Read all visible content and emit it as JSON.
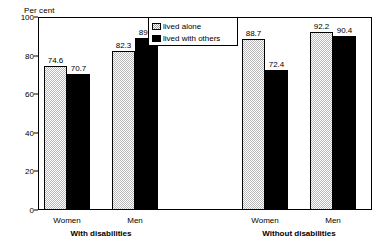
{
  "chart_data": {
    "type": "bar",
    "title": "",
    "xlabel": "",
    "ylabel": "Per cent",
    "ylim": [
      0,
      100
    ],
    "yticks": [
      0,
      20,
      40,
      60,
      80,
      100
    ],
    "grid": false,
    "legend_position": "top-center",
    "categories": [
      "Women",
      "Men",
      "Women",
      "Men"
    ],
    "groups": [
      {
        "name": "With disabilities",
        "categories": [
          "Women",
          "Men"
        ]
      },
      {
        "name": "Without disabilities",
        "categories": [
          "Women",
          "Men"
        ]
      }
    ],
    "series": [
      {
        "name": "lived alone",
        "values": [
          74.6,
          82.3,
          88.7,
          92.2
        ]
      },
      {
        "name": "lived with others",
        "values": [
          70.7,
          89.3,
          72.4,
          90.4
        ]
      }
    ],
    "data_labels": [
      "74.6",
      "70.7",
      "82.3",
      "89.3",
      "88.7",
      "72.4",
      "92.2",
      "90.4"
    ]
  },
  "axis": {
    "unit_caption": "Per cent",
    "ytick_labels": [
      "100",
      "80",
      "60",
      "40",
      "20",
      "0"
    ]
  },
  "legend": {
    "items": [
      {
        "label": "lived alone",
        "swatch": "hatched-gray"
      },
      {
        "label": "lived with others",
        "swatch": "solid-black"
      }
    ]
  },
  "xaxis": {
    "category_labels": [
      "Women",
      "Men",
      "Women",
      "Men"
    ],
    "group_labels": [
      "With disabilities",
      "Without disabilities"
    ]
  },
  "colors": {
    "lived_alone": "#b9b9b9",
    "lived_with_others": "#000000",
    "axis": "#000000",
    "background": "#ffffff"
  }
}
